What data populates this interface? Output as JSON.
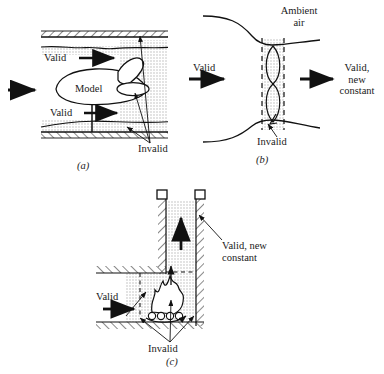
{
  "figure": {
    "type": "technical-diagram",
    "panels": [
      {
        "id": "(a)",
        "name": "wind-tunnel-model",
        "labels": {
          "model": "Model",
          "valid_upper": "Valid",
          "valid_lower": "Valid",
          "invalid": "Invalid"
        }
      },
      {
        "id": "(b)",
        "name": "jet-nozzle",
        "labels": {
          "ambient": "Ambient\nair",
          "valid_in": "Valid",
          "valid_out": "Valid,\nnew\nconstant",
          "invalid": "Invalid"
        }
      },
      {
        "id": "(c)",
        "name": "furnace-chimney",
        "labels": {
          "valid_in": "Valid",
          "valid_out": "Valid, new\nconstant",
          "invalid": "Invalid"
        }
      }
    ]
  },
  "colors": {
    "ink": "#1a1a1a",
    "stipple": "#cfcfcf",
    "hatch": "#2a2a2a",
    "paper": "#ffffff"
  }
}
